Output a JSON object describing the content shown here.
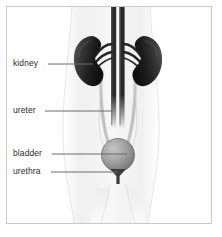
{
  "figure": {
    "background_color": "#ffffff",
    "frame_color": "#c9c9c9",
    "text_color": "#2b2b2b",
    "leader_line_color": "#6b6b6b"
  },
  "labels": [
    {
      "id": "kidney",
      "text": "kidney",
      "text_x": 13,
      "text_y": 58,
      "line_x1": 48,
      "line_x2": 93,
      "line_y": 64
    },
    {
      "id": "ureter",
      "text": "ureter",
      "text_x": 13,
      "text_y": 105,
      "line_x1": 45,
      "line_x2": 112,
      "line_y": 111
    },
    {
      "id": "bladder",
      "text": "bladder",
      "text_x": 13,
      "text_y": 148,
      "line_x1": 52,
      "line_x2": 127,
      "line_y": 154
    },
    {
      "id": "urethra",
      "text": "urethra",
      "text_x": 13,
      "text_y": 166,
      "line_x1": 51,
      "line_x2": 118,
      "line_y": 172
    }
  ],
  "organs": [
    {
      "id": "kidney-left",
      "name": "kidney",
      "side": "left",
      "color_dark": "#1a1a1a",
      "color_light": "#6e6e6e",
      "center_x": 93,
      "center_y": 62
    },
    {
      "id": "kidney-right",
      "name": "kidney",
      "side": "right",
      "color_dark": "#1a1a1a",
      "color_light": "#6e6e6e",
      "center_x": 144,
      "center_y": 62
    },
    {
      "id": "bladder",
      "name": "bladder",
      "color_dark": "#6f6f6f",
      "color_light": "#b8b8b8",
      "center_x": 118,
      "center_y": 155,
      "radius": 16
    },
    {
      "id": "urethra",
      "name": "urethra",
      "color": "#3c3c3c",
      "center_x": 118,
      "top_y": 170,
      "bottom_y": 183
    },
    {
      "id": "vena-cava",
      "name": "inferior vena cava",
      "color": "#2a2a2a"
    },
    {
      "id": "aorta",
      "name": "abdominal aorta",
      "color": "#2a2a2a"
    },
    {
      "id": "ureter-tubes",
      "name": "ureters",
      "color": "#bfbfbf"
    },
    {
      "id": "body-silhouette",
      "name": "torso silhouette",
      "color": "#f2f2f2"
    }
  ]
}
